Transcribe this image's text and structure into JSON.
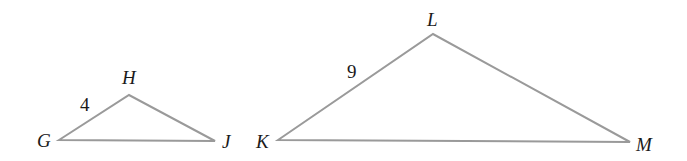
{
  "diagram": {
    "type": "similar-triangles",
    "stroke_color": "#9a9a9a",
    "text_color": "#1a1a1a",
    "triangles": [
      {
        "name": "GHJ",
        "vertices": {
          "G": {
            "label": "G",
            "x": 59,
            "y": 140
          },
          "H": {
            "label": "H",
            "x": 129,
            "y": 95
          },
          "J": {
            "label": "J",
            "x": 215,
            "y": 141
          }
        },
        "side_labels": [
          {
            "side": "GH",
            "text": "4"
          }
        ]
      },
      {
        "name": "KLM",
        "vertices": {
          "K": {
            "label": "K",
            "x": 278,
            "y": 140
          },
          "L": {
            "label": "L",
            "x": 433,
            "y": 34
          },
          "M": {
            "label": "M",
            "x": 630,
            "y": 142
          }
        },
        "side_labels": [
          {
            "side": "KL",
            "text": "9"
          }
        ]
      }
    ]
  },
  "labels": {
    "G": "G",
    "H": "H",
    "J": "J",
    "K": "K",
    "L": "L",
    "M": "M",
    "side_GH": "4",
    "side_KL": "9"
  }
}
